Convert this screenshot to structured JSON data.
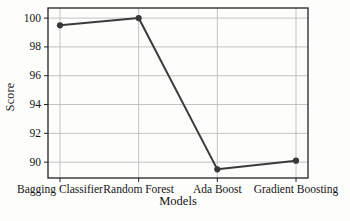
{
  "figure": {
    "background": "#fdfdfc",
    "border_color": "#222222",
    "grid_color": "#bcbcbc",
    "line_color": "#3b3b3b",
    "marker_color": "#383838",
    "text_color": "#141414"
  },
  "chart_data": {
    "type": "line",
    "title": "",
    "xlabel": "Models",
    "ylabel": "Score",
    "categories": [
      "Bagging Classifier",
      "Random Forest",
      "Ada Boost",
      "Gradient Boosting"
    ],
    "series": [
      {
        "name": "Score",
        "values": [
          99.5,
          100.0,
          89.5,
          90.1
        ]
      }
    ],
    "yticks": [
      90,
      92,
      94,
      96,
      98,
      100
    ],
    "ylim": [
      88.9,
      100.7
    ],
    "grid": true,
    "legend": false,
    "marker": "circle"
  }
}
